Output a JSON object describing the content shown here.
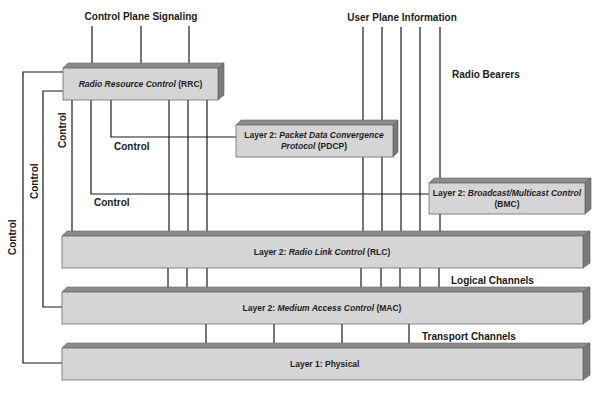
{
  "diagram": {
    "title_labels": {
      "control_plane": "Control Plane Signaling",
      "user_plane": "User Plane Information",
      "radio_bearers": "Radio Bearers",
      "logical_channels": "Logical Channels",
      "transport_channels": "Transport Channels"
    },
    "control_labels": {
      "pdcp_control": "Control",
      "bmc_control": "Control",
      "rlc_control": "Control",
      "mac_control": "Control",
      "phy_control": "Control"
    },
    "blocks": {
      "rrc": {
        "prefix": "",
        "italic": "Radio Resource Control",
        "suffix": " (RRC)"
      },
      "pdcp": {
        "prefix": "Layer 2: ",
        "italic": "Packet Data Convergence",
        "line2_italic": "Protocol",
        "line2_suffix": " (PDCP)"
      },
      "bmc": {
        "prefix": "Layer 2: ",
        "italic": "Broadcast/Multicast Control",
        "line2": "(BMC)"
      },
      "rlc": {
        "prefix": "Layer 2: ",
        "italic": "Radio Link Control",
        "suffix": " (RLC)"
      },
      "mac": {
        "prefix": "Layer 2: ",
        "italic": "Medium Access Control",
        "suffix": " (MAC)"
      },
      "phy": {
        "prefix": "Layer 1: Physical"
      }
    }
  }
}
